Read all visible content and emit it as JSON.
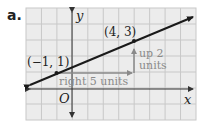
{
  "figure": {
    "part_label": "a.",
    "x_axis_label": "x",
    "y_axis_label": "y",
    "origin_label": "O",
    "grid": {
      "x_min": -3,
      "x_max": 8,
      "y_min": -2,
      "y_max": 5
    },
    "points": [
      {
        "label": "(−1, 1)",
        "x": -1,
        "y": 1
      },
      {
        "label": "(4, 3)",
        "x": 4,
        "y": 3
      }
    ],
    "annotations": {
      "run": "right 5 units",
      "rise_line1": "up 2",
      "rise_line2": "units"
    },
    "colors": {
      "grid_line": "#c8c8c8",
      "grid_bg": "#ececec",
      "axis": "#333333",
      "line": "#1a1a1a",
      "annotation": "#8a8a8a"
    }
  }
}
